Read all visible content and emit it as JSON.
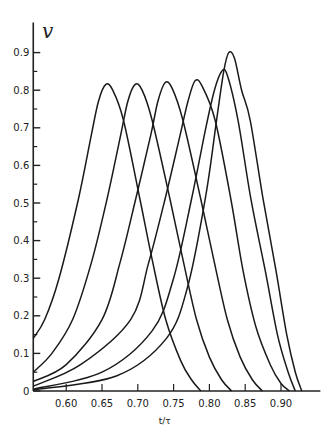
{
  "chart_data": {
    "type": "line",
    "title": "",
    "xlabel": "t/τ",
    "ylabel": "v",
    "xlim": [
      0.554,
      0.955
    ],
    "ylim": [
      0,
      0.98
    ],
    "grid": false,
    "legend": "none",
    "x_ticks": [
      0.6,
      0.65,
      0.7,
      0.75,
      0.8,
      0.85,
      0.9
    ],
    "x_tick_labels": [
      "0.60",
      "0.65",
      "0.70",
      "0.75",
      "0.80",
      "0.85",
      "0.90"
    ],
    "y_ticks": [
      0,
      0.1,
      0.2,
      0.3,
      0.4,
      0.5,
      0.6,
      0.7,
      0.8,
      0.9
    ],
    "y_tick_labels": [
      "0",
      "0.1",
      "0.2",
      "0.3",
      "0.4",
      "0.5",
      "0.6",
      "0.7",
      "0.8",
      "0.9"
    ],
    "y_minor_ticks": [
      0.05,
      0.15,
      0.25,
      0.35,
      0.45,
      0.55,
      0.65,
      0.75,
      0.85
    ],
    "series": [
      {
        "name": "curve-1",
        "peak": [
          0.655,
          0.815
        ],
        "points": [
          [
            0.554,
            0.14
          ],
          [
            0.57,
            0.19
          ],
          [
            0.59,
            0.3
          ],
          [
            0.617,
            0.51
          ],
          [
            0.635,
            0.68
          ],
          [
            0.645,
            0.77
          ],
          [
            0.655,
            0.815
          ],
          [
            0.665,
            0.8
          ],
          [
            0.68,
            0.72
          ],
          [
            0.703,
            0.51
          ],
          [
            0.72,
            0.35
          ],
          [
            0.739,
            0.19
          ],
          [
            0.76,
            0.08
          ],
          [
            0.775,
            0.03
          ],
          [
            0.788,
            0
          ]
        ]
      },
      {
        "name": "curve-2",
        "peak": [
          0.696,
          0.815
        ],
        "points": [
          [
            0.554,
            0.05
          ],
          [
            0.58,
            0.1
          ],
          [
            0.609,
            0.19
          ],
          [
            0.635,
            0.34
          ],
          [
            0.657,
            0.51
          ],
          [
            0.676,
            0.68
          ],
          [
            0.686,
            0.77
          ],
          [
            0.696,
            0.815
          ],
          [
            0.706,
            0.8
          ],
          [
            0.72,
            0.72
          ],
          [
            0.745,
            0.51
          ],
          [
            0.763,
            0.35
          ],
          [
            0.782,
            0.19
          ],
          [
            0.8,
            0.09
          ],
          [
            0.817,
            0.03
          ],
          [
            0.831,
            0
          ]
        ]
      },
      {
        "name": "curve-3",
        "peak": [
          0.738,
          0.82
        ],
        "points": [
          [
            0.554,
            0.025
          ],
          [
            0.6,
            0.07
          ],
          [
            0.65,
            0.19
          ],
          [
            0.675,
            0.34
          ],
          [
            0.697,
            0.51
          ],
          [
            0.718,
            0.68
          ],
          [
            0.728,
            0.77
          ],
          [
            0.738,
            0.82
          ],
          [
            0.748,
            0.805
          ],
          [
            0.763,
            0.72
          ],
          [
            0.788,
            0.51
          ],
          [
            0.806,
            0.35
          ],
          [
            0.825,
            0.19
          ],
          [
            0.843,
            0.09
          ],
          [
            0.86,
            0.03
          ],
          [
            0.874,
            0
          ]
        ]
      },
      {
        "name": "curve-4",
        "peak": [
          0.78,
          0.825
        ],
        "points": [
          [
            0.554,
            0.013
          ],
          [
            0.62,
            0.07
          ],
          [
            0.69,
            0.19
          ],
          [
            0.715,
            0.34
          ],
          [
            0.738,
            0.51
          ],
          [
            0.759,
            0.68
          ],
          [
            0.77,
            0.77
          ],
          [
            0.78,
            0.825
          ],
          [
            0.79,
            0.81
          ],
          [
            0.808,
            0.72
          ],
          [
            0.83,
            0.51
          ],
          [
            0.847,
            0.32
          ],
          [
            0.865,
            0.17
          ],
          [
            0.885,
            0.07
          ],
          [
            0.9,
            0.02
          ],
          [
            0.912,
            0
          ]
        ]
      },
      {
        "name": "curve-5",
        "peak": [
          0.817,
          0.85
        ],
        "points": [
          [
            0.554,
            0.005
          ],
          [
            0.65,
            0.05
          ],
          [
            0.72,
            0.16
          ],
          [
            0.75,
            0.3
          ],
          [
            0.775,
            0.51
          ],
          [
            0.795,
            0.7
          ],
          [
            0.807,
            0.8
          ],
          [
            0.817,
            0.85
          ],
          [
            0.825,
            0.84
          ],
          [
            0.84,
            0.72
          ],
          [
            0.858,
            0.51
          ],
          [
            0.878,
            0.32
          ],
          [
            0.895,
            0.15
          ],
          [
            0.91,
            0.05
          ],
          [
            0.92,
            0
          ]
        ]
      },
      {
        "name": "curve-6",
        "peak": [
          0.827,
          0.9
        ],
        "points": [
          [
            0.554,
            0.003
          ],
          [
            0.67,
            0.04
          ],
          [
            0.74,
            0.14
          ],
          [
            0.77,
            0.28
          ],
          [
            0.795,
            0.52
          ],
          [
            0.81,
            0.72
          ],
          [
            0.82,
            0.85
          ],
          [
            0.827,
            0.9
          ],
          [
            0.835,
            0.885
          ],
          [
            0.845,
            0.8
          ],
          [
            0.857,
            0.72
          ],
          [
            0.875,
            0.51
          ],
          [
            0.893,
            0.32
          ],
          [
            0.908,
            0.15
          ],
          [
            0.92,
            0.05
          ],
          [
            0.929,
            0
          ]
        ]
      }
    ]
  }
}
